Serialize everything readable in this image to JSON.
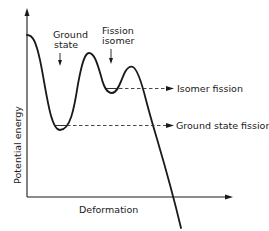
{
  "diagram": {
    "type": "potential-energy-curve",
    "axes": {
      "y_label": "Potential energy",
      "x_label": "Deformation"
    },
    "annotations": {
      "ground_state": {
        "line1": "Ground",
        "line2": "state"
      },
      "fission_isomer": {
        "line1": "Fission",
        "line2": "isomer"
      }
    },
    "levels": {
      "isomer_fission": "Isomer fission",
      "ground_state_fission": "Ground state fission"
    },
    "colors": {
      "ink": "#1a1a1a",
      "background": "#ffffff"
    }
  }
}
